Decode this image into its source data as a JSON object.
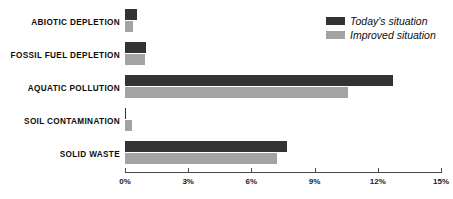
{
  "chart_data": {
    "type": "bar",
    "orientation": "horizontal",
    "title": "",
    "xlabel": "",
    "ylabel": "",
    "xlim": [
      0,
      15
    ],
    "xunit": "%",
    "grid": false,
    "legend_position": "top-right",
    "categories": [
      "ABIOTIC DEPLETION",
      "FOSSIL FUEL DEPLETION",
      "AQUATIC POLLUTION",
      "SOIL CONTAMINATION",
      "SOLID WASTE"
    ],
    "tick_labels": [
      "0%",
      "3%",
      "6%",
      "9%",
      "12%",
      "15%"
    ],
    "tick_values": [
      0,
      3,
      6,
      9,
      12,
      15
    ],
    "series": [
      {
        "name": "Today's situation",
        "color": "#333333",
        "values": [
          0.55,
          1.0,
          12.7,
          0.05,
          7.7
        ]
      },
      {
        "name": "Improved situation",
        "color": "#a3a3a3",
        "values": [
          0.4,
          0.95,
          10.6,
          0.35,
          7.2
        ]
      }
    ]
  },
  "legend": {
    "items": [
      {
        "label": "Today's situation"
      },
      {
        "label": "Improved situation"
      }
    ]
  }
}
